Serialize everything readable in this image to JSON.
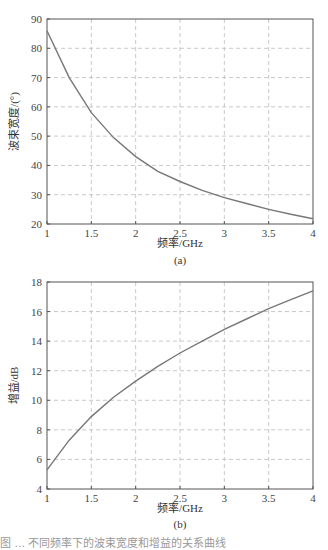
{
  "chart_data": [
    {
      "type": "line",
      "panel_label": "(a)",
      "title": "",
      "xlabel": "频率/GHz",
      "ylabel": "波束宽度/(°)",
      "xlim": [
        1,
        4
      ],
      "ylim": [
        20,
        90
      ],
      "xticks": [
        1,
        1.5,
        2,
        2.5,
        3,
        3.5,
        4
      ],
      "xtick_labels": [
        "1",
        "1.5",
        "2",
        "2.5",
        "3",
        "3.5",
        "4"
      ],
      "yticks": [
        20,
        30,
        40,
        50,
        60,
        70,
        80,
        90
      ],
      "ytick_labels": [
        "20",
        "30",
        "40",
        "50",
        "60",
        "70",
        "80",
        "90"
      ],
      "grid": true,
      "series": [
        {
          "name": "beamwidth",
          "x": [
            1,
            1.25,
            1.5,
            1.75,
            2,
            2.25,
            2.5,
            2.75,
            3,
            3.25,
            3.5,
            3.75,
            4
          ],
          "y": [
            86,
            70,
            58,
            49.5,
            43,
            38,
            34.5,
            31.5,
            29,
            27,
            25,
            23.3,
            21.8
          ]
        }
      ]
    },
    {
      "type": "line",
      "panel_label": "(b)",
      "title": "",
      "xlabel": "频率/GHz",
      "ylabel": "增益/dB",
      "xlim": [
        1,
        4
      ],
      "ylim": [
        4,
        18
      ],
      "xticks": [
        1,
        1.5,
        2,
        2.5,
        3,
        3.5,
        4
      ],
      "xtick_labels": [
        "1",
        "1.5",
        "2",
        "2.5",
        "3",
        "3.5",
        "4"
      ],
      "yticks": [
        4,
        6,
        8,
        10,
        12,
        14,
        16,
        18
      ],
      "ytick_labels": [
        "4",
        "6",
        "8",
        "10",
        "12",
        "14",
        "16",
        "18"
      ],
      "grid": true,
      "series": [
        {
          "name": "gain",
          "x": [
            1,
            1.25,
            1.5,
            1.75,
            2,
            2.25,
            2.5,
            2.75,
            3,
            3.25,
            3.5,
            3.75,
            4
          ],
          "y": [
            5.3,
            7.3,
            8.9,
            10.2,
            11.3,
            12.3,
            13.2,
            14.0,
            14.8,
            15.5,
            16.2,
            16.8,
            17.4
          ]
        }
      ]
    }
  ],
  "caption": "图 ... 不同频率下的波束宽度和增益的关系曲线"
}
